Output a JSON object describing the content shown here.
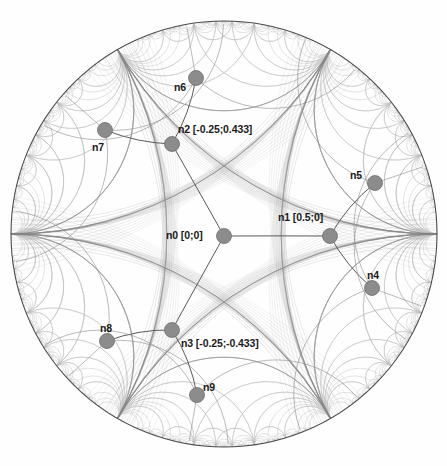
{
  "figure": {
    "kind": "poincare-disk",
    "title": "",
    "disk": {
      "cx": 224,
      "cy": 234,
      "r": 213
    },
    "colors": {
      "boundary": "#4a4a4a",
      "tessellation_near": "#8a8a8a",
      "tessellation_far": "#bdbdbd",
      "edge": "#5a5a5a",
      "node_fill": "#8c8c8c",
      "node_stroke": "#6e6e6e",
      "label_text": "#1a1a1a",
      "background": "#fefefe"
    },
    "node_radius_px": 7.5
  },
  "nodes": [
    {
      "id": "n0",
      "label": "n0 [0;0]",
      "coord": [
        0,
        0
      ],
      "px": 224,
      "py": 236,
      "label_x": 166,
      "label_y": 230,
      "anchor": "left"
    },
    {
      "id": "n1",
      "label": "n1 [0.5;0]",
      "coord": [
        0.5,
        0
      ],
      "px": 330,
      "py": 236,
      "label_x": 278,
      "label_y": 212,
      "anchor": "left"
    },
    {
      "id": "n2",
      "label": "n2 [-0.25;0.433]",
      "coord": [
        -0.25,
        0.433
      ],
      "px": 172,
      "py": 144,
      "label_x": 178,
      "label_y": 124,
      "anchor": "left"
    },
    {
      "id": "n3",
      "label": "n3 [-0.25;-0.433]",
      "coord": [
        -0.25,
        -0.433
      ],
      "px": 172,
      "py": 330,
      "label_x": 181,
      "label_y": 338,
      "anchor": "left"
    },
    {
      "id": "n4",
      "label": "n4",
      "coord": null,
      "px": 372,
      "py": 288,
      "label_x": 367,
      "label_y": 270,
      "anchor": "left"
    },
    {
      "id": "n5",
      "label": "n5",
      "coord": null,
      "px": 375,
      "py": 183,
      "label_x": 350,
      "label_y": 170,
      "anchor": "left"
    },
    {
      "id": "n6",
      "label": "n6",
      "coord": null,
      "px": 196,
      "py": 78,
      "label_x": 174,
      "label_y": 82,
      "anchor": "left"
    },
    {
      "id": "n7",
      "label": "n7",
      "coord": null,
      "px": 105,
      "py": 130,
      "label_x": 92,
      "label_y": 142,
      "anchor": "left"
    },
    {
      "id": "n8",
      "label": "n8",
      "coord": null,
      "px": 107,
      "py": 341,
      "label_x": 100,
      "label_y": 323,
      "anchor": "left"
    },
    {
      "id": "n9",
      "label": "n9",
      "coord": null,
      "px": 197,
      "py": 395,
      "label_x": 203,
      "label_y": 382,
      "anchor": "left"
    }
  ],
  "edges": [
    {
      "from": "n0",
      "to": "n1"
    },
    {
      "from": "n0",
      "to": "n2"
    },
    {
      "from": "n0",
      "to": "n3"
    },
    {
      "from": "n1",
      "to": "n4"
    },
    {
      "from": "n1",
      "to": "n5"
    },
    {
      "from": "n2",
      "to": "n6"
    },
    {
      "from": "n2",
      "to": "n7"
    },
    {
      "from": "n3",
      "to": "n8"
    },
    {
      "from": "n3",
      "to": "n9"
    }
  ],
  "ideal_points": [
    {
      "name": "left-cusp",
      "px": 16,
      "py": 235
    },
    {
      "name": "upper-right-cusp",
      "px": 330,
      "py": 66
    },
    {
      "name": "lower-right-cusp",
      "px": 330,
      "py": 404
    },
    {
      "name": "upper-left-cusp",
      "px": 118,
      "py": 66
    },
    {
      "name": "lower-left-cusp",
      "px": 118,
      "py": 404
    },
    {
      "name": "right-cusp",
      "px": 432,
      "py": 235
    }
  ]
}
